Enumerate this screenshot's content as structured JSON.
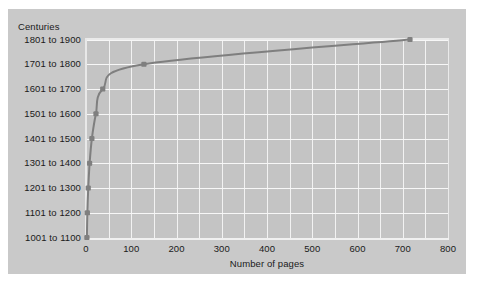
{
  "figure": {
    "y_axis_title": "Centuries",
    "x_axis_title": "Number of pages",
    "panel_color": "#c9c9c9",
    "plot_background": "#c4c4c4",
    "grid_color": "#f4f4f4",
    "line_color": "#7f7f7f",
    "marker_color": "#7f7f7f",
    "text_color": "#1a1a1a"
  },
  "x_ticks": [
    {
      "label": "0",
      "value": 0
    },
    {
      "label": "100",
      "value": 100
    },
    {
      "label": "200",
      "value": 200
    },
    {
      "label": "300",
      "value": 300
    },
    {
      "label": "400",
      "value": 400
    },
    {
      "label": "500",
      "value": 500
    },
    {
      "label": "600",
      "value": 600
    },
    {
      "label": "700",
      "value": 700
    },
    {
      "label": "800",
      "value": 800
    }
  ],
  "y_ticks": [
    {
      "label": "1001 to 1100",
      "index": 0
    },
    {
      "label": "1101 to 1200",
      "index": 1
    },
    {
      "label": "1201 to 1300",
      "index": 2
    },
    {
      "label": "1301 to 1400",
      "index": 3
    },
    {
      "label": "1401 to 1500",
      "index": 4
    },
    {
      "label": "1501 to 1600",
      "index": 5
    },
    {
      "label": "1601 to 1700",
      "index": 6
    },
    {
      "label": "1701 to 1800",
      "index": 7
    },
    {
      "label": "1801 to 1900",
      "index": 8
    }
  ],
  "chart_data": {
    "type": "line",
    "title": "",
    "subtitle": "",
    "xlabel": "Number of pages",
    "ylabel": "Centuries",
    "xlim": [
      0,
      800
    ],
    "xticks": [
      0,
      100,
      200,
      300,
      400,
      500,
      600,
      700,
      800
    ],
    "x_minor_tick_step": 50,
    "ycategories": [
      "1001 to 1100",
      "1101 to 1200",
      "1201 to 1300",
      "1301 to 1400",
      "1401 to 1500",
      "1501 to 1600",
      "1601 to 1700",
      "1701 to 1800",
      "1801 to 1900"
    ],
    "grid": true,
    "legend": null,
    "markers": true,
    "series": [
      {
        "name": "Number of pages by century",
        "x": [
          2,
          3,
          5,
          8,
          13,
          22,
          37,
          128,
          716
        ],
        "y": [
          "1001 to 1100",
          "1101 to 1200",
          "1201 to 1300",
          "1301 to 1400",
          "1401 to 1500",
          "1501 to 1600",
          "1601 to 1700",
          "1701 to 1800",
          "1801 to 1900"
        ],
        "color": "#7f7f7f"
      }
    ]
  }
}
